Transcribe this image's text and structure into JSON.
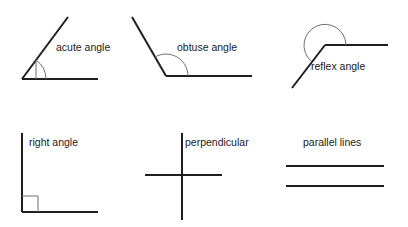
{
  "page": {
    "background_color": "#ffffff",
    "line_color": "#1f1f1f",
    "marker_color": "#6e6e6e",
    "text_color": "#1a1a1a",
    "width": 408,
    "height": 227
  },
  "figures": [
    {
      "id": "acute-angle",
      "label": "acute angle",
      "label_x": 56,
      "label_y": 51,
      "marker": "arc",
      "rays": "ray-up-right and ray-right from vertex",
      "vertex_x": 22,
      "vertex_y": 79,
      "baseline": "M22,79 L98,79",
      "diagonal": "M22,79 L68,17",
      "arc": "M46,79 A24,24 0 0 0 36,60",
      "arc_tick": "M36,60 L36,79"
    },
    {
      "id": "obtuse-angle",
      "label": "obtuse angle",
      "label_x": 177,
      "label_y": 51,
      "marker": "arc",
      "rays": "ray-up-left and ray-right from vertex",
      "vertex_x": 166,
      "vertex_y": 76,
      "baseline": "M166,76 L252,76",
      "diagonal": "M166,76 L132,17",
      "arc": "M188,76 A22,22 0 0 0 155,57",
      "arc_tick": ""
    },
    {
      "id": "reflex-angle",
      "label": "reflex angle",
      "label_x": 311,
      "label_y": 70,
      "marker": "large-arc",
      "rays": "ray-right and ray-down-left from vertex",
      "vertex_x": 325,
      "vertex_y": 45,
      "baseline": "M325,45 L388,45",
      "diagonal": "M325,45 L292,88",
      "arc": "M346,45 A21,21 0 1 0 311,61",
      "arc_tick": ""
    },
    {
      "id": "right-angle",
      "label": "right angle",
      "label_x": 29,
      "label_y": 146,
      "marker": "square",
      "rays": "ray-up and ray-right from corner",
      "vertex_x": 22,
      "vertex_y": 212,
      "baseline": "M22,212 L98,212",
      "diagonal": "M22,133 L22,212",
      "square": "M22,196 L38,196 L38,212",
      "arc": "",
      "arc_tick": ""
    },
    {
      "id": "perpendicular",
      "label": "perpendicular",
      "label_x": 185,
      "label_y": 146,
      "marker": "none",
      "rays": "crossing vertical and horizontal lines",
      "vertex_x": 182,
      "vertex_y": 175,
      "baseline": "M145,175 L222,175",
      "diagonal": "M182,133 L182,220",
      "arc": "",
      "arc_tick": ""
    },
    {
      "id": "parallel-lines",
      "label": "parallel lines",
      "label_x": 303,
      "label_y": 146,
      "marker": "none",
      "rays": "two horizontal non-intersecting lines",
      "vertex_x": 0,
      "vertex_y": 0,
      "baseline": "M286,166 L384,166",
      "diagonal": "M286,186 L384,186",
      "arc": "",
      "arc_tick": ""
    }
  ]
}
